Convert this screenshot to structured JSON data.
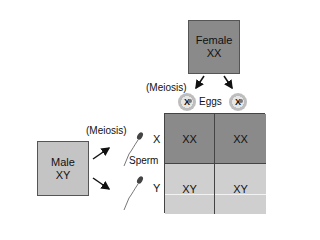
{
  "female": {
    "title": "Female",
    "genotype": "XX"
  },
  "male": {
    "title": "Male",
    "genotype": "XY"
  },
  "labels": {
    "meiosis_female": "(Meiosis)",
    "meiosis_male": "(Meiosis)",
    "eggs": "Eggs",
    "sperm": "Sperm"
  },
  "eggs": [
    {
      "chromosome": "X"
    },
    {
      "chromosome": "X"
    }
  ],
  "sperm_rows": [
    {
      "chromosome": "X"
    },
    {
      "chromosome": "Y"
    }
  ],
  "punnett": {
    "rows": [
      [
        "XX",
        "XX"
      ],
      [
        "XY",
        "XY"
      ]
    ]
  },
  "colors": {
    "female_fill": "#8a8a8a",
    "male_fill": "#c4c4c4",
    "xx_cell": "#8a8a8a",
    "xy_cell": "#cfcfcf"
  }
}
